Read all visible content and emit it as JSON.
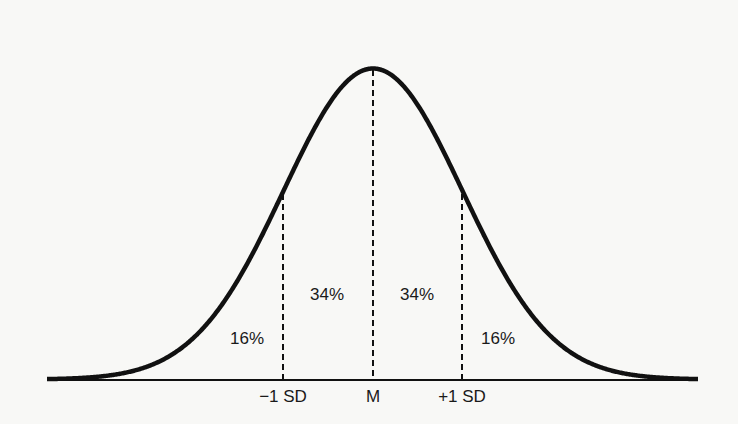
{
  "chart_data": {
    "type": "area",
    "title": "",
    "xlabel": "",
    "ylabel": "",
    "distribution": "normal",
    "grid": false,
    "legend": null,
    "x_ticks": [
      "-1 SD",
      "M",
      "+1 SD"
    ],
    "x_tick_sd": [
      -1,
      0,
      1
    ],
    "regions": [
      {
        "name": "below -1 SD",
        "from_sd": -3.6,
        "to_sd": -1,
        "percent": 16,
        "label": "16%"
      },
      {
        "name": "-1 SD to M",
        "from_sd": -1,
        "to_sd": 0,
        "percent": 34,
        "label": "34%"
      },
      {
        "name": "M to +1 SD",
        "from_sd": 0,
        "to_sd": 1,
        "percent": 34,
        "label": "34%"
      },
      {
        "name": "above +1 SD",
        "from_sd": 1,
        "to_sd": 3.6,
        "percent": 16,
        "label": "16%"
      }
    ]
  },
  "labels": {
    "tick_minus1": "−1 SD",
    "tick_mean": "M",
    "tick_plus1": "+1 SD",
    "pct_left_tail": "16%",
    "pct_left_center": "34%",
    "pct_right_center": "34%",
    "pct_right_tail": "16%"
  },
  "colors": {
    "ink": "#111111",
    "background": "#f8f8f6"
  }
}
